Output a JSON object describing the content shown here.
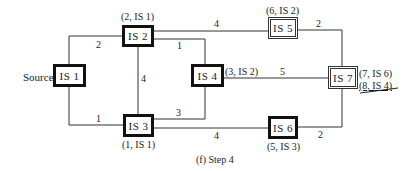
{
  "caption": "(f)  Step 4",
  "source_label": "Source",
  "nodes": [
    {
      "id": "IS1",
      "label": "IS  1",
      "style": "thick",
      "annotation": ""
    },
    {
      "id": "IS2",
      "label": "IS  2",
      "style": "thick",
      "annotation": "(2, IS  1)"
    },
    {
      "id": "IS3",
      "label": "IS  3",
      "style": "thick",
      "annotation": "(1, IS  1)"
    },
    {
      "id": "IS4",
      "label": "IS  4",
      "style": "thick",
      "annotation": "(3, IS  2)"
    },
    {
      "id": "IS5",
      "label": "IS  5",
      "style": "double",
      "annotation": "(6, IS  2)"
    },
    {
      "id": "IS6",
      "label": "IS  6",
      "style": "thick",
      "annotation": "(5, IS  3)"
    },
    {
      "id": "IS7",
      "label": "IS  7",
      "style": "double",
      "annotation": "(7, IS  6)",
      "struck_annotation": "(8, IS  4)"
    }
  ],
  "edges": [
    {
      "from": "IS1",
      "to": "IS2",
      "weight": "2"
    },
    {
      "from": "IS1",
      "to": "IS3",
      "weight": "1"
    },
    {
      "from": "IS2",
      "to": "IS3",
      "weight": "4"
    },
    {
      "from": "IS2",
      "to": "IS4",
      "weight": "1"
    },
    {
      "from": "IS2",
      "to": "IS5",
      "weight": "4"
    },
    {
      "from": "IS3",
      "to": "IS4",
      "weight": "3"
    },
    {
      "from": "IS3",
      "to": "IS6",
      "weight": "4"
    },
    {
      "from": "IS4",
      "to": "IS7",
      "weight": "5"
    },
    {
      "from": "IS5",
      "to": "IS7",
      "weight": "2"
    },
    {
      "from": "IS6",
      "to": "IS7",
      "weight": "2"
    }
  ]
}
